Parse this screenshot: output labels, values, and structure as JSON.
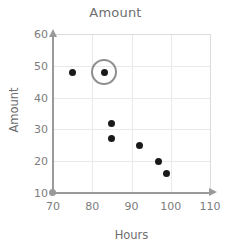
{
  "chart_data": {
    "type": "scatter",
    "title": "Amount",
    "xlabel": "Hours",
    "ylabel": "Amount",
    "xlim": [
      70,
      110
    ],
    "ylim": [
      10,
      60
    ],
    "xticks": [
      70,
      80,
      90,
      100,
      110
    ],
    "yticks": [
      10,
      20,
      30,
      40,
      50,
      60
    ],
    "grid": true,
    "legend": null,
    "points": [
      {
        "x": 75,
        "y": 48,
        "highlighted": false
      },
      {
        "x": 83,
        "y": 48,
        "highlighted": true
      },
      {
        "x": 85,
        "y": 32,
        "highlighted": false
      },
      {
        "x": 85,
        "y": 27,
        "highlighted": false
      },
      {
        "x": 92,
        "y": 25,
        "highlighted": false
      },
      {
        "x": 97,
        "y": 20,
        "highlighted": false
      },
      {
        "x": 99,
        "y": 16,
        "highlighted": false
      }
    ],
    "annotations": [
      {
        "kind": "circle-highlight",
        "x": 83,
        "y": 48
      }
    ],
    "colors": {
      "marker": "#1a1a1a",
      "highlight_ring": "#8f8f8f",
      "grid": "#e9e9e9",
      "axis": "#9a9a9a",
      "text": "#7a7a7a"
    }
  }
}
